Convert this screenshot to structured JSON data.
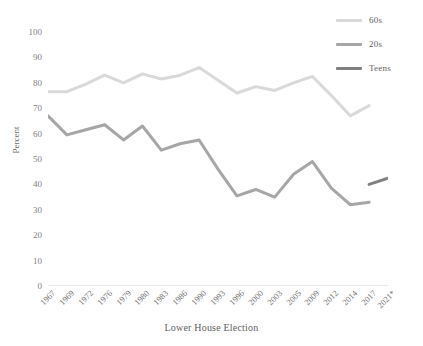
{
  "chart_data": {
    "type": "line",
    "title": "",
    "xlabel": "Lower House Election",
    "ylabel": "Percent",
    "ylim": [
      0,
      100
    ],
    "ytick_step": 10,
    "yticks": [
      100,
      90,
      80,
      70,
      60,
      50,
      40,
      30,
      20,
      10,
      0
    ],
    "grid": false,
    "legend_position": "top-right",
    "categories": [
      "1967",
      "1969",
      "1972",
      "1976",
      "1979",
      "1980",
      "1983",
      "1986",
      "1990",
      "1993",
      "1996",
      "2000",
      "2003",
      "2005",
      "2009",
      "2012",
      "2014",
      "2017",
      "2021*"
    ],
    "series": [
      {
        "name": "60s",
        "color": "#d9d9d9",
        "values": [
          76.5,
          76.5,
          79.5,
          83,
          80,
          83.5,
          81.5,
          83,
          86,
          81,
          76,
          78.5,
          77,
          80,
          82.5,
          75,
          67,
          71,
          null
        ]
      },
      {
        "name": "20s",
        "color": "#a6a6a6",
        "values": [
          67,
          59.5,
          61.5,
          63.5,
          57.5,
          63,
          53.5,
          56,
          57.5,
          46,
          35.5,
          38,
          35,
          44,
          49,
          38.5,
          32,
          33,
          null
        ]
      },
      {
        "name": "Teens",
        "color": "#808080",
        "values": [
          null,
          null,
          null,
          null,
          null,
          null,
          null,
          null,
          null,
          null,
          null,
          null,
          null,
          null,
          null,
          null,
          null,
          40,
          42.5
        ]
      }
    ]
  },
  "legend": {
    "items": [
      {
        "label": "60s",
        "color": "#d9d9d9"
      },
      {
        "label": "20s",
        "color": "#a6a6a6"
      },
      {
        "label": "Teens",
        "color": "#808080"
      }
    ]
  },
  "axes": {
    "y_title": "Percent",
    "x_title": "Lower House Election"
  },
  "colors": {
    "axis_line": "#d0d0d0",
    "tick_text": "#808080",
    "series_60s": "#d9d9d9",
    "series_20s": "#a6a6a6",
    "series_teens": "#808080"
  }
}
